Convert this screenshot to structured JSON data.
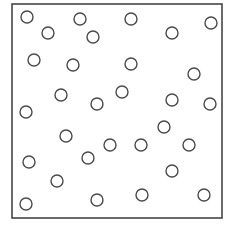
{
  "diagram": {
    "background": "#ffffff",
    "frame": {
      "x": 12,
      "y": 4,
      "width": 210,
      "height": 214,
      "stroke": "#3a3a3a",
      "stroke_width": 1.5
    },
    "circle_style": {
      "radius": 6,
      "stroke": "#4a4a4a",
      "stroke_width": 1.4,
      "fill": "#ffffff"
    },
    "circles": [
      {
        "cx": 27,
        "cy": 17
      },
      {
        "cx": 48,
        "cy": 33
      },
      {
        "cx": 80,
        "cy": 19
      },
      {
        "cx": 93,
        "cy": 37
      },
      {
        "cx": 131,
        "cy": 19
      },
      {
        "cx": 172,
        "cy": 33
      },
      {
        "cx": 211,
        "cy": 23
      },
      {
        "cx": 34,
        "cy": 60
      },
      {
        "cx": 73,
        "cy": 65
      },
      {
        "cx": 131,
        "cy": 64
      },
      {
        "cx": 194,
        "cy": 74
      },
      {
        "cx": 61,
        "cy": 95
      },
      {
        "cx": 97,
        "cy": 104
      },
      {
        "cx": 122,
        "cy": 92
      },
      {
        "cx": 172,
        "cy": 100
      },
      {
        "cx": 210,
        "cy": 104
      },
      {
        "cx": 26,
        "cy": 112
      },
      {
        "cx": 66,
        "cy": 136
      },
      {
        "cx": 164,
        "cy": 127
      },
      {
        "cx": 88,
        "cy": 158
      },
      {
        "cx": 110,
        "cy": 145
      },
      {
        "cx": 141,
        "cy": 145
      },
      {
        "cx": 189,
        "cy": 145
      },
      {
        "cx": 29,
        "cy": 162
      },
      {
        "cx": 57,
        "cy": 181
      },
      {
        "cx": 172,
        "cy": 171
      },
      {
        "cx": 26,
        "cy": 204
      },
      {
        "cx": 97,
        "cy": 200
      },
      {
        "cx": 142,
        "cy": 195
      },
      {
        "cx": 204,
        "cy": 195
      }
    ],
    "circle_count": 30
  }
}
